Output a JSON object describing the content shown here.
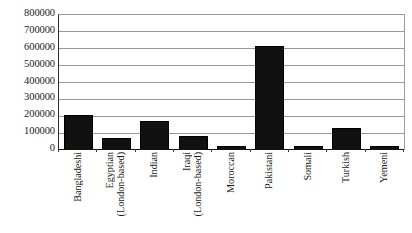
{
  "chart_data": {
    "type": "bar",
    "title": "",
    "xlabel": "",
    "ylabel": "",
    "ylim": [
      0,
      800000
    ],
    "grid": true,
    "legend": "none",
    "bar_color": "#111111",
    "gridline_color": "#9a9a9a",
    "axis_color": "#111111",
    "y_ticks": [
      "800000",
      "700000",
      "600000",
      "500000",
      "400000",
      "300000",
      "200000",
      "100000",
      "0"
    ],
    "y_tick_values": [
      800000,
      700000,
      600000,
      500000,
      400000,
      300000,
      200000,
      100000,
      0
    ],
    "categories": [
      "Bangladeshi",
      "Egyptian (London-based)",
      "Indian",
      "Iraqi (London-based)",
      "Moroccan",
      "Pakistani",
      "Somali",
      "Turkish",
      "Yemeni"
    ],
    "category_lines": [
      [
        "Bangladeshi"
      ],
      [
        "Egyptian",
        "(London-based)"
      ],
      [
        "Indian"
      ],
      [
        "Iraqi",
        "(London-based)"
      ],
      [
        "Moroccan"
      ],
      [
        "Pakistani"
      ],
      [
        "Somali"
      ],
      [
        "Turkish"
      ],
      [
        "Yemeni"
      ]
    ],
    "values": [
      205000,
      70000,
      170000,
      80000,
      20000,
      615000,
      20000,
      128000,
      22000
    ]
  }
}
